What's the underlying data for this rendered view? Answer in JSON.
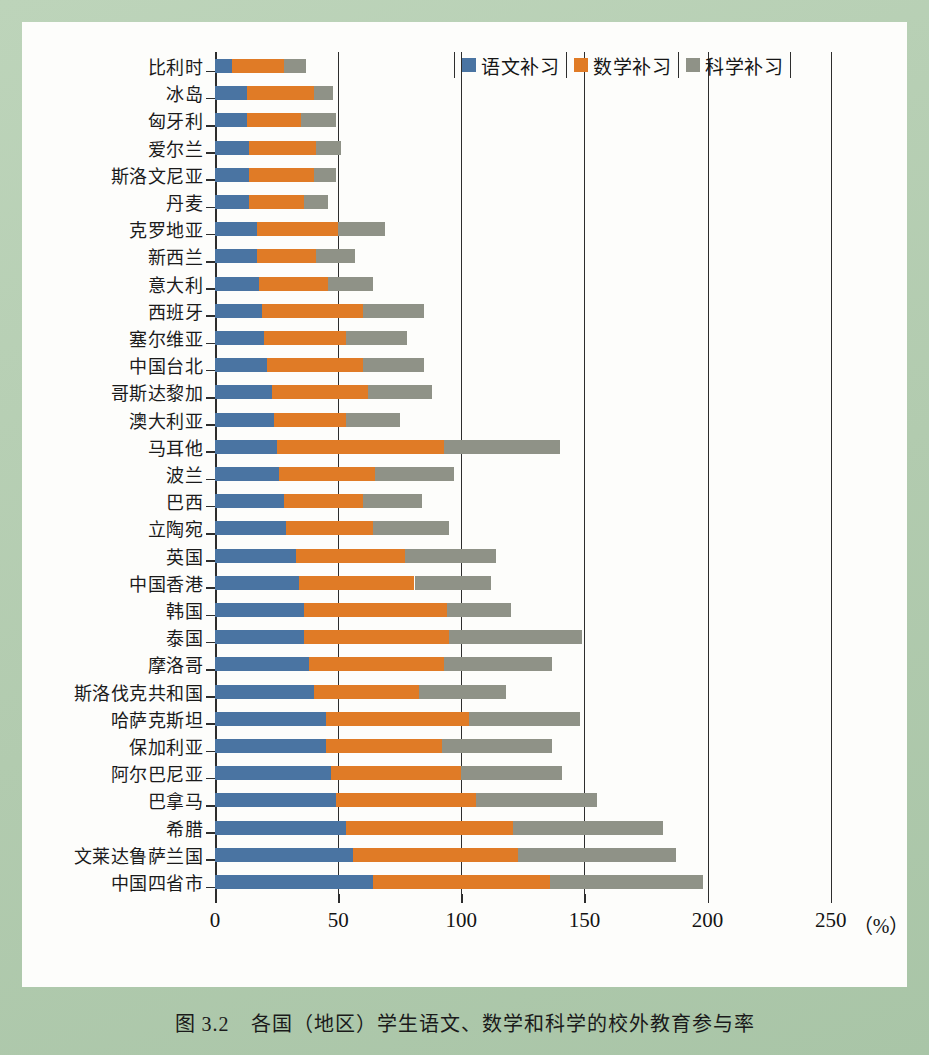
{
  "caption": "图 3.2　各国（地区）学生语文、数学和科学的校外教育参与率",
  "legend": {
    "items": [
      {
        "label": "语文补习",
        "color": "#4a74a2",
        "name": "chinese"
      },
      {
        "label": "数学补习",
        "color": "#e07b26",
        "name": "math"
      },
      {
        "label": "科学补习",
        "color": "#8f9287",
        "name": "science"
      }
    ]
  },
  "axis": {
    "unit_label": "（%）",
    "ticks": [
      "0",
      "50",
      "100",
      "150",
      "200",
      "250"
    ]
  },
  "chart_data": {
    "type": "bar",
    "orientation": "horizontal",
    "stacked": true,
    "title": "图 3.2　各国（地区）学生语文、数学和科学的校外教育参与率",
    "xlabel": "（%）",
    "ylabel": "",
    "xlim": [
      0,
      260
    ],
    "xticks": [
      0,
      50,
      100,
      150,
      200,
      250
    ],
    "grid": "vertical",
    "legend_position": "top-right",
    "categories": [
      "比利时",
      "冰岛",
      "匈牙利",
      "爱尔兰",
      "斯洛文尼亚",
      "丹麦",
      "克罗地亚",
      "新西兰",
      "意大利",
      "西班牙",
      "塞尔维亚",
      "中国台北",
      "哥斯达黎加",
      "澳大利亚",
      "马耳他",
      "波兰",
      "巴西",
      "立陶宛",
      "英国",
      "中国香港",
      "韩国",
      "泰国",
      "摩洛哥",
      "斯洛伐克共和国",
      "哈萨克斯坦",
      "保加利亚",
      "阿尔巴尼亚",
      "巴拿马",
      "希腊",
      "文莱达鲁萨兰国",
      "中国四省市"
    ],
    "series": [
      {
        "name": "语文补习",
        "color": "#4a74a2",
        "values": [
          7,
          13,
          13,
          14,
          14,
          14,
          17,
          17,
          18,
          19,
          20,
          21,
          23,
          24,
          25,
          26,
          28,
          29,
          33,
          34,
          36,
          36,
          38,
          40,
          45,
          45,
          47,
          49,
          53,
          56,
          64
        ]
      },
      {
        "name": "数学补习",
        "color": "#e07b26",
        "values": [
          21,
          27,
          22,
          27,
          26,
          22,
          33,
          24,
          28,
          41,
          33,
          39,
          39,
          29,
          68,
          39,
          32,
          35,
          44,
          47,
          58,
          59,
          55,
          43,
          58,
          47,
          53,
          57,
          68,
          67,
          72
        ]
      },
      {
        "name": "科学补习",
        "color": "#8f9287",
        "values": [
          9,
          8,
          14,
          10,
          9,
          10,
          19,
          16,
          18,
          25,
          25,
          25,
          26,
          22,
          47,
          32,
          24,
          31,
          37,
          31,
          26,
          54,
          44,
          35,
          45,
          45,
          41,
          49,
          61,
          64,
          62
        ]
      }
    ],
    "totals": [
      37,
      48,
      49,
      51,
      49,
      46,
      69,
      57,
      64,
      85,
      78,
      85,
      88,
      75,
      140,
      97,
      84,
      95,
      114,
      112,
      120,
      149,
      137,
      118,
      148,
      137,
      141,
      155,
      182,
      187,
      198
    ]
  }
}
